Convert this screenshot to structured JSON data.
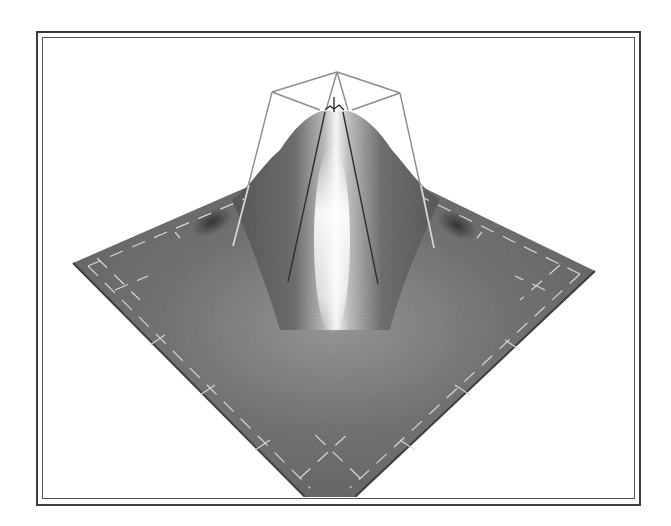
{
  "figure": {
    "frame": {
      "style": "double-line border",
      "outer_color": "#3c3c3c",
      "inner_color": "#555555"
    },
    "surface": {
      "shape": "gaussian-bell",
      "base_color": "#6e6e6e",
      "shadow_color": "#3a3a3a",
      "highlight_color": "#ffffff",
      "grid_line_color": "#d8d8d8"
    },
    "wireframe": {
      "color": "#8a8a8a",
      "inner_line_color": "#2e2e2e"
    }
  }
}
